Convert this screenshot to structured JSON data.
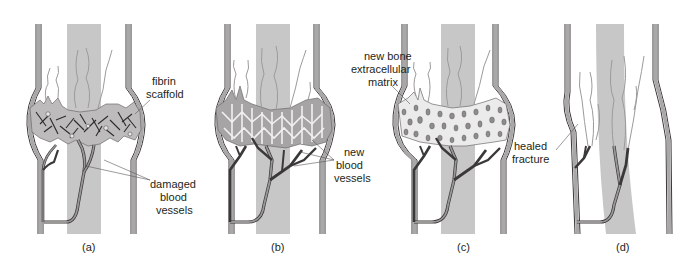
{
  "figure": {
    "panels": [
      {
        "id": "a",
        "caption": "(a)",
        "labels": [
          {
            "text_lines": [
              "fibrin",
              "scaffold"
            ]
          },
          {
            "text_lines": [
              "damaged",
              "blood",
              "vessels"
            ]
          }
        ]
      },
      {
        "id": "b",
        "caption": "(b)",
        "labels": [
          {
            "text_lines": [
              "new",
              "blood",
              "vessels"
            ]
          }
        ]
      },
      {
        "id": "c",
        "caption": "(c)",
        "labels": [
          {
            "text_lines": [
              "new bone",
              "extracellular",
              "matrix"
            ]
          }
        ]
      },
      {
        "id": "d",
        "caption": "(d)",
        "labels": [
          {
            "text_lines": [
              "healed",
              "fracture"
            ]
          }
        ]
      }
    ],
    "colors": {
      "marrow": "#c8c7c7",
      "bone_wall": "#9d9b9b",
      "callus": "#b5b3b3",
      "vessel": "#8a8787",
      "outline": "#3a3838",
      "label": "#231f20"
    }
  }
}
